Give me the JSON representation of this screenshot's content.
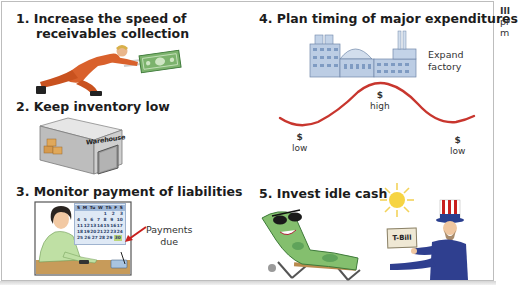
{
  "figure": {
    "panels": [
      {
        "number": "1.",
        "title_line1": "Increase the speed of",
        "title_line2": "receivables collection",
        "illustration": "skater-chasing-dollar"
      },
      {
        "number": "2.",
        "title": "Keep inventory low",
        "illustration": "warehouse",
        "sign": "Warehouse"
      },
      {
        "number": "3.",
        "title": "Monitor payment of liabilities",
        "illustration": "woman-with-calendar",
        "annotation_line1": "Payments",
        "annotation_line2": "due"
      },
      {
        "number": "4.",
        "title": "Plan timing of major expenditures",
        "illustration": "factory-and-cash-curve",
        "factory_label_line1": "Expand",
        "factory_label_line2": "factory",
        "curve_labels": [
          {
            "symbol": "$",
            "text": "low"
          },
          {
            "symbol": "$",
            "text": "high"
          },
          {
            "symbol": "$",
            "text": "low"
          }
        ]
      },
      {
        "number": "5.",
        "title": "Invest idle cash",
        "illustration": "dollar-on-lounger-and-uncle-sam",
        "tbill_label": "T-Bill"
      }
    ],
    "calendar": {
      "header": [
        "S",
        "M",
        "Tu",
        "W",
        "Th",
        "F",
        "S"
      ],
      "rows": [
        [
          "",
          "",
          "",
          "",
          "",
          "1",
          "2",
          "3"
        ],
        [
          "4",
          "5",
          "6",
          "7",
          "8",
          "9",
          "10"
        ],
        [
          "11",
          "12",
          "13",
          "14",
          "15",
          "16",
          "17"
        ],
        [
          "18",
          "19",
          "20",
          "21",
          "22",
          "23",
          "24"
        ],
        [
          "25",
          "26",
          "27",
          "28",
          "29",
          "30"
        ]
      ],
      "due_day": "30"
    }
  },
  "caption_fragment": {
    "line1": "Ill",
    "line2": "pr",
    "line3": "m"
  },
  "colors": {
    "curve": "#c8362e",
    "money_green": "#5fa35a",
    "factory_blue": "#b9cbe3",
    "skater_orange": "#d9612c"
  }
}
